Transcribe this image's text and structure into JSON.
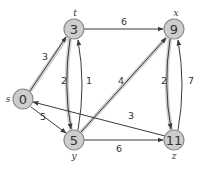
{
  "diagram": {
    "type": "directed-weighted-graph",
    "colors": {
      "node_fill": "#cdcdcd",
      "node_stroke": "#8a8a8a",
      "edge": "#3a3a3a",
      "highlight": "#c8c8c8"
    },
    "nodes": [
      {
        "id": "s",
        "name": "s",
        "value": "0",
        "x": 23,
        "y": 99
      },
      {
        "id": "t",
        "name": "t",
        "value": "3",
        "x": 74,
        "y": 29
      },
      {
        "id": "x",
        "name": "x",
        "value": "9",
        "x": 174,
        "y": 29
      },
      {
        "id": "y",
        "name": "y",
        "value": "5",
        "x": 74,
        "y": 140
      },
      {
        "id": "z",
        "name": "z",
        "value": "11",
        "x": 174,
        "y": 140
      }
    ],
    "edges": [
      {
        "from": "s",
        "to": "t",
        "weight": "3",
        "highlighted": true
      },
      {
        "from": "s",
        "to": "y",
        "weight": "5",
        "highlighted": false
      },
      {
        "from": "t",
        "to": "x",
        "weight": "6",
        "highlighted": false
      },
      {
        "from": "t",
        "to": "y",
        "weight": "2",
        "highlighted": true
      },
      {
        "from": "y",
        "to": "t",
        "weight": "1",
        "highlighted": false
      },
      {
        "from": "y",
        "to": "x",
        "weight": "4",
        "highlighted": true
      },
      {
        "from": "y",
        "to": "z",
        "weight": "6",
        "highlighted": false
      },
      {
        "from": "x",
        "to": "z",
        "weight": "2",
        "highlighted": true
      },
      {
        "from": "z",
        "to": "x",
        "weight": "7",
        "highlighted": false
      },
      {
        "from": "z",
        "to": "s",
        "weight": "3",
        "highlighted": false
      }
    ]
  }
}
